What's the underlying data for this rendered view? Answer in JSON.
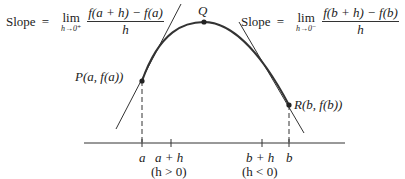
{
  "left_formula": {
    "prefix": "Slope",
    "equals": "=",
    "lim": "lim",
    "lim_sub": "h→0⁺",
    "numerator": "f(a + h) − f(a)",
    "denominator": "h"
  },
  "right_formula": {
    "prefix": "Slope",
    "equals": "=",
    "lim": "lim",
    "lim_sub": "h→0⁻",
    "numerator": "f(b + h) − f(b)",
    "denominator": "h"
  },
  "points": {
    "P": "P(a, f(a))",
    "Q": "Q",
    "R": "R(b, f(b))"
  },
  "axis_labels": {
    "a": "a",
    "a_plus_h": "a + h",
    "a_plus_h_cond": "(h > 0)",
    "b_plus_h": "b + h",
    "b_plus_h_cond": "(h < 0)",
    "b": "b"
  }
}
